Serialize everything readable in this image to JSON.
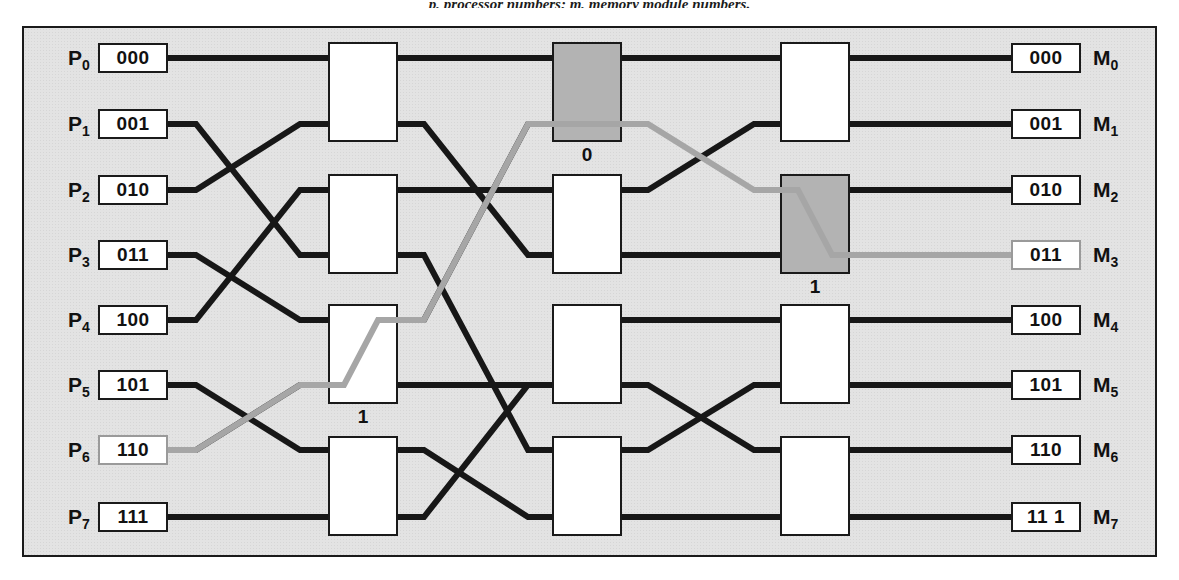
{
  "caption": "p, processor numbers; m, memory module numbers.",
  "colors": {
    "background": "#e3e3e3",
    "page": "#ffffff",
    "wire_normal": "#171717",
    "wire_highlight": "#a6a6a6",
    "box_shaded": "#b3b3b3",
    "box_plain": "#ffffff",
    "border": "#1a1a1a"
  },
  "diagram": {
    "type": "omega-interconnection-network",
    "stage_count": 3,
    "row_count": 8
  },
  "processors": [
    {
      "label": "P",
      "index": "0",
      "value": "000",
      "highlighted": false
    },
    {
      "label": "P",
      "index": "1",
      "value": "001",
      "highlighted": false
    },
    {
      "label": "P",
      "index": "2",
      "value": "010",
      "highlighted": false
    },
    {
      "label": "P",
      "index": "3",
      "value": "011",
      "highlighted": false
    },
    {
      "label": "P",
      "index": "4",
      "value": "100",
      "highlighted": false
    },
    {
      "label": "P",
      "index": "5",
      "value": "101",
      "highlighted": false
    },
    {
      "label": "P",
      "index": "6",
      "value": "110",
      "highlighted": true
    },
    {
      "label": "P",
      "index": "7",
      "value": "111",
      "highlighted": false
    }
  ],
  "memories": [
    {
      "label": "M",
      "index": "0",
      "value": "000",
      "highlighted": false
    },
    {
      "label": "M",
      "index": "1",
      "value": "001",
      "highlighted": false
    },
    {
      "label": "M",
      "index": "2",
      "value": "010",
      "highlighted": false
    },
    {
      "label": "M",
      "index": "3",
      "value": "011",
      "highlighted": true
    },
    {
      "label": "M",
      "index": "4",
      "value": "100",
      "highlighted": false
    },
    {
      "label": "M",
      "index": "5",
      "value": "101",
      "highlighted": false
    },
    {
      "label": "M",
      "index": "6",
      "value": "110",
      "highlighted": false
    },
    {
      "label": "M",
      "index": "7",
      "value": "11 1",
      "highlighted": false
    }
  ],
  "switches": [
    {
      "stage": 1,
      "row": 0,
      "shaded": false,
      "label": "",
      "state": "through"
    },
    {
      "stage": 1,
      "row": 1,
      "shaded": false,
      "label": "",
      "state": "through"
    },
    {
      "stage": 1,
      "row": 2,
      "shaded": false,
      "label": "1",
      "state": "cross-up"
    },
    {
      "stage": 1,
      "row": 3,
      "shaded": false,
      "label": "",
      "state": "through"
    },
    {
      "stage": 2,
      "row": 0,
      "shaded": true,
      "label": "0",
      "state": "through"
    },
    {
      "stage": 2,
      "row": 1,
      "shaded": false,
      "label": "",
      "state": "through"
    },
    {
      "stage": 2,
      "row": 2,
      "shaded": false,
      "label": "",
      "state": "through"
    },
    {
      "stage": 2,
      "row": 3,
      "shaded": false,
      "label": "",
      "state": "through"
    },
    {
      "stage": 3,
      "row": 0,
      "shaded": false,
      "label": "",
      "state": "through"
    },
    {
      "stage": 3,
      "row": 1,
      "shaded": true,
      "label": "1",
      "state": "cross-down"
    },
    {
      "stage": 3,
      "row": 2,
      "shaded": false,
      "label": "",
      "state": "through"
    },
    {
      "stage": 3,
      "row": 3,
      "shaded": false,
      "label": "",
      "state": "through"
    }
  ],
  "highlighted_route": {
    "source": "110",
    "destination": "011",
    "switch_settings": [
      "1",
      "0",
      "1"
    ]
  }
}
